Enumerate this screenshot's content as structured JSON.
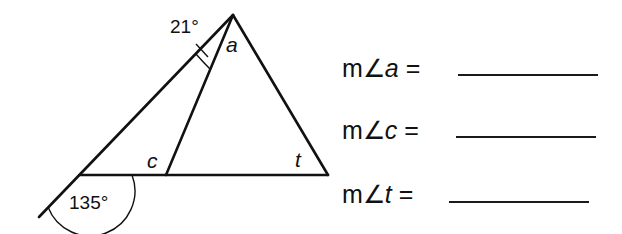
{
  "diagram": {
    "angle_labels": {
      "top_given": "21°",
      "exterior_given": "135°",
      "a": "a",
      "c": "c",
      "t": "t"
    }
  },
  "questions": [
    {
      "prefix": "m∠",
      "var": "a",
      "equals": "=",
      "answer": ""
    },
    {
      "prefix": "m∠",
      "var": "c",
      "equals": "=",
      "answer": ""
    },
    {
      "prefix": "m∠",
      "var": "t",
      "equals": "=",
      "answer": ""
    }
  ]
}
